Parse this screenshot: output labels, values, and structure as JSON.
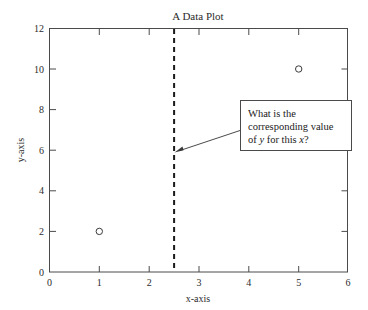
{
  "chart_data": {
    "type": "scatter",
    "title": "A Data Plot",
    "xlabel": "x-axis",
    "ylabel": "y-axis",
    "xlim": [
      0,
      6
    ],
    "ylim": [
      0,
      12
    ],
    "grid": false,
    "legend": null,
    "x_ticks": [
      "0",
      "1",
      "2",
      "3",
      "4",
      "5",
      "6"
    ],
    "x_tick_values": [
      0,
      1,
      2,
      3,
      4,
      5,
      6
    ],
    "y_ticks": [
      "0",
      "2",
      "4",
      "6",
      "8",
      "10",
      "12"
    ],
    "y_tick_values": [
      0,
      2,
      4,
      6,
      8,
      10,
      12
    ],
    "series": [
      {
        "name": "data points",
        "marker": "open-circle",
        "points": [
          {
            "x": 1,
            "y": 2
          },
          {
            "x": 5,
            "y": 10
          }
        ]
      }
    ],
    "reference_lines": [
      {
        "name": "query-x",
        "orientation": "vertical",
        "value": 2.5,
        "style": "dashed",
        "color": "#1a1a1a"
      }
    ],
    "annotations": [
      {
        "name": "question-callout",
        "lines": [
          {
            "parts": [
              {
                "text": "What is the",
                "italic": false
              }
            ]
          },
          {
            "parts": [
              {
                "text": "corresponding value",
                "italic": false
              }
            ]
          },
          {
            "parts": [
              {
                "text": "of ",
                "italic": false
              },
              {
                "text": "y",
                "italic": true
              },
              {
                "text": " for this ",
                "italic": false
              },
              {
                "text": "x",
                "italic": true
              },
              {
                "text": "?",
                "italic": false
              }
            ]
          }
        ],
        "points_to": {
          "x": 2.5,
          "y": 5.9
        }
      }
    ],
    "colors": {
      "axis": "#4a4a4a",
      "text": "#2b2b2b",
      "marker": "#3a3a3a",
      "reference_line": "#1a1a1a",
      "background": "#ffffff"
    }
  }
}
